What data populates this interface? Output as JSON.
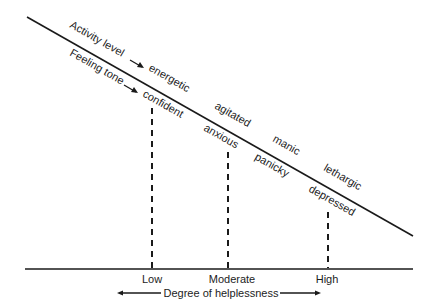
{
  "diagram": {
    "series_labels": {
      "activity": "Activity level",
      "feeling": "Feeling tone"
    },
    "activity_states": [
      "energetic",
      "agitated",
      "manic",
      "lethargic"
    ],
    "feeling_states": [
      "confident",
      "anxious",
      "panicky",
      "depressed"
    ],
    "levels": [
      "Low",
      "Moderate",
      "High"
    ],
    "axis_title": "Degree of helplessness",
    "line_color": "#1a1a1a",
    "background": "#ffffff"
  }
}
